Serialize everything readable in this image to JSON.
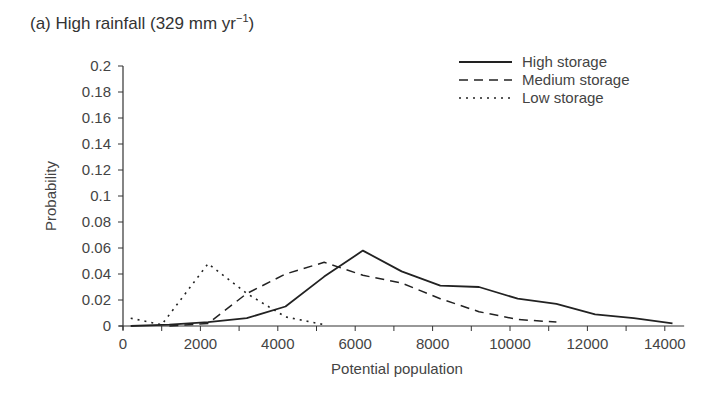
{
  "chart_data": {
    "type": "line",
    "title_main": "(a) High rainfall (329 mm yr",
    "title_sup": "−1",
    "title_end": ")",
    "xlabel": "Potential population",
    "ylabel": "Probability",
    "xlim": [
      0,
      14500
    ],
    "ylim": [
      0,
      0.2
    ],
    "xticks": [
      0,
      2000,
      4000,
      6000,
      8000,
      10000,
      12000,
      14000
    ],
    "yticks": [
      0,
      0.02,
      0.04,
      0.06,
      0.08,
      0.1,
      0.12,
      0.14,
      0.16,
      0.18,
      0.2
    ],
    "ytick_labels": [
      "0",
      "0.02",
      "0.04",
      "0.06",
      "0.08",
      "0.1",
      "0.12",
      "0.14",
      "0.16",
      "0.18",
      "0.2"
    ],
    "grid": false,
    "legend_position": "upper right",
    "series": [
      {
        "name": "High storage",
        "style": "solid",
        "x": [
          200,
          1200,
          2200,
          3200,
          4200,
          5200,
          6200,
          7200,
          8200,
          9200,
          10200,
          11200,
          12200,
          13200,
          14200
        ],
        "y": [
          0.0,
          0.001,
          0.003,
          0.006,
          0.015,
          0.038,
          0.058,
          0.042,
          0.031,
          0.03,
          0.021,
          0.017,
          0.009,
          0.006,
          0.002
        ]
      },
      {
        "name": "Medium storage",
        "style": "dashed",
        "x": [
          1200,
          2200,
          3200,
          4200,
          5200,
          6200,
          7200,
          8200,
          9200,
          10200,
          11200
        ],
        "y": [
          0.0,
          0.002,
          0.025,
          0.04,
          0.049,
          0.039,
          0.033,
          0.021,
          0.011,
          0.005,
          0.003
        ]
      },
      {
        "name": "Low storage",
        "style": "dotted",
        "x": [
          200,
          1000,
          2200,
          3200,
          4200,
          5200
        ],
        "y": [
          0.006,
          0.001,
          0.048,
          0.025,
          0.007,
          0.001
        ]
      }
    ]
  }
}
